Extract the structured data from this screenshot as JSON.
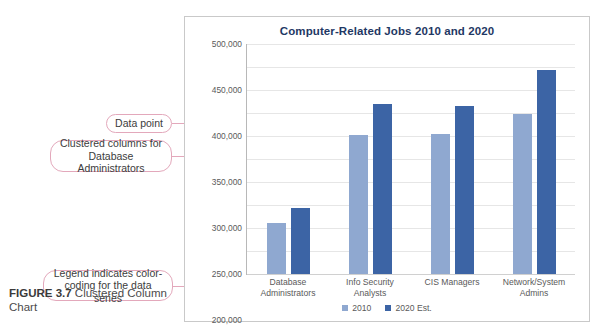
{
  "figure": {
    "label": "FIGURE 3.7",
    "caption": "Clustered Column Chart"
  },
  "callouts": {
    "data_point": "Data point",
    "clustered_columns": "Clustered columns for Database Administrators",
    "legend_note": "Legend indicates color-coding for the data series"
  },
  "colors": {
    "series_2010": "#8fa8d0",
    "series_2020": "#3c64a5",
    "title": "#1f3864",
    "callout_border": "#e3a8bb",
    "gridline": "#e6e6e6"
  },
  "page_bottom_text": "",
  "chart_data": {
    "type": "bar",
    "title": "Computer-Related Jobs 2010 and 2020",
    "xlabel": "",
    "ylabel": "",
    "ylim": [
      0,
      500000
    ],
    "ytick_step": 50000,
    "yticks": [
      "50,000",
      "100,000",
      "150,000",
      "200,000",
      "250,000",
      "300,000",
      "350,000",
      "400,000",
      "450,000",
      "500,000"
    ],
    "ytick_values": [
      50000,
      100000,
      150000,
      200000,
      250000,
      300000,
      350000,
      400000,
      450000,
      500000
    ],
    "grid": true,
    "legend_position": "bottom",
    "categories": [
      "Database Administrators",
      "Info Security Analysts",
      "CIS Managers",
      "Network/System Admins"
    ],
    "series": [
      {
        "name": "2010",
        "values": [
          110000,
          302000,
          305000,
          347000
        ]
      },
      {
        "name": "2020 Est.",
        "values": [
          144000,
          370000,
          365000,
          443000
        ]
      }
    ]
  }
}
